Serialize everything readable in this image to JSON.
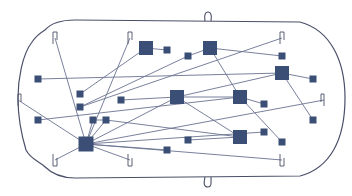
{
  "diagram": {
    "title": "",
    "colors": {
      "background": "#ffffff",
      "outline": "#4a5068",
      "node_fill": "#3b4e75",
      "edge": "#6a7391"
    },
    "nodes": [
      {
        "id": "A",
        "x": 146,
        "y": 48,
        "size": 14,
        "kind": "large"
      },
      {
        "id": "B",
        "x": 210,
        "y": 48,
        "size": 14,
        "kind": "large"
      },
      {
        "id": "C",
        "x": 282,
        "y": 73,
        "size": 14,
        "kind": "large"
      },
      {
        "id": "D",
        "x": 177,
        "y": 97,
        "size": 14,
        "kind": "large"
      },
      {
        "id": "E",
        "x": 240,
        "y": 97,
        "size": 14,
        "kind": "large"
      },
      {
        "id": "F",
        "x": 86,
        "y": 144,
        "size": 15,
        "kind": "large"
      },
      {
        "id": "G",
        "x": 240,
        "y": 137,
        "size": 14,
        "kind": "large"
      },
      {
        "id": "s1",
        "x": 167,
        "y": 50,
        "size": 7,
        "kind": "small"
      },
      {
        "id": "s2",
        "x": 188,
        "y": 56,
        "size": 7,
        "kind": "small"
      },
      {
        "id": "s3",
        "x": 38,
        "y": 79,
        "size": 7,
        "kind": "small"
      },
      {
        "id": "s4",
        "x": 313,
        "y": 79,
        "size": 7,
        "kind": "small"
      },
      {
        "id": "s5",
        "x": 80,
        "y": 94,
        "size": 7,
        "kind": "small"
      },
      {
        "id": "s6",
        "x": 80,
        "y": 107,
        "size": 7,
        "kind": "small"
      },
      {
        "id": "s7",
        "x": 121,
        "y": 100,
        "size": 7,
        "kind": "small"
      },
      {
        "id": "s8",
        "x": 93,
        "y": 120,
        "size": 7,
        "kind": "small"
      },
      {
        "id": "s9",
        "x": 106,
        "y": 120,
        "size": 7,
        "kind": "small"
      },
      {
        "id": "s10",
        "x": 38,
        "y": 120,
        "size": 7,
        "kind": "small"
      },
      {
        "id": "s11",
        "x": 264,
        "y": 104,
        "size": 7,
        "kind": "small"
      },
      {
        "id": "s12",
        "x": 282,
        "y": 56,
        "size": 7,
        "kind": "small"
      },
      {
        "id": "s13",
        "x": 313,
        "y": 120,
        "size": 7,
        "kind": "small"
      },
      {
        "id": "s14",
        "x": 264,
        "y": 132,
        "size": 7,
        "kind": "small"
      },
      {
        "id": "s15",
        "x": 282,
        "y": 142,
        "size": 7,
        "kind": "small"
      },
      {
        "id": "s16",
        "x": 188,
        "y": 140,
        "size": 7,
        "kind": "small"
      },
      {
        "id": "s17",
        "x": 167,
        "y": 150,
        "size": 7,
        "kind": "small"
      }
    ],
    "edges": [
      [
        "A",
        "s1"
      ],
      [
        "A",
        "s5"
      ],
      [
        "B",
        "s12"
      ],
      [
        "B",
        "E"
      ],
      [
        "B",
        "s2"
      ],
      [
        "s2",
        "s6"
      ],
      [
        "s3",
        "C"
      ],
      [
        "C",
        "s4"
      ],
      [
        "C",
        "s13"
      ],
      [
        "C",
        "D"
      ],
      [
        "s7",
        "D"
      ],
      [
        "D",
        "E"
      ],
      [
        "E",
        "s11"
      ],
      [
        "E",
        "s15"
      ],
      [
        "D",
        "G"
      ],
      [
        "s10",
        "E"
      ],
      [
        "s16",
        "G"
      ],
      [
        "s17",
        "F"
      ],
      [
        "F",
        "s8"
      ],
      [
        "F",
        "s9"
      ],
      [
        "s8",
        "s9"
      ],
      [
        "s9",
        "G"
      ],
      [
        "F",
        "D"
      ],
      [
        "F",
        "s14"
      ]
    ],
    "wires": [
      {
        "from": "F",
        "to_clip": "clip-top-1"
      },
      {
        "from": "F",
        "to_clip": "clip-top-2"
      },
      {
        "from": "F",
        "to_clip": "clip-bottom-1"
      },
      {
        "from": "F",
        "to_clip": "clip-bottom-2"
      },
      {
        "from": "F",
        "to_clip": "clip-side-left"
      },
      {
        "from": "F",
        "to_clip": "clip-side-right"
      },
      {
        "from": "F",
        "to_clip": "clip-bottom-3"
      },
      {
        "from": "s6",
        "to_clip": "clip-top-3"
      }
    ],
    "clips": [
      {
        "id": "clip-top-1",
        "x": 55,
        "y": 38,
        "dir": "down"
      },
      {
        "id": "clip-top-2",
        "x": 130,
        "y": 38,
        "dir": "down"
      },
      {
        "id": "clip-top-3",
        "x": 282,
        "y": 38,
        "dir": "down"
      },
      {
        "id": "clip-bottom-1",
        "x": 55,
        "y": 160,
        "dir": "up"
      },
      {
        "id": "clip-bottom-2",
        "x": 130,
        "y": 160,
        "dir": "up"
      },
      {
        "id": "clip-bottom-3",
        "x": 282,
        "y": 160,
        "dir": "up"
      },
      {
        "id": "clip-side-left",
        "x": 18,
        "y": 100,
        "dir": "right"
      },
      {
        "id": "clip-side-right",
        "x": 324,
        "y": 100,
        "dir": "left"
      }
    ]
  }
}
